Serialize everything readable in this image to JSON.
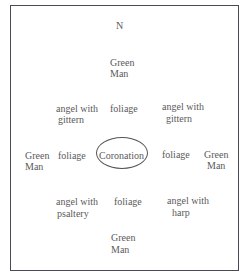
{
  "diagram": {
    "north": "N",
    "top_green_man": [
      "Green",
      "Man"
    ],
    "row1": {
      "left": [
        "angel with",
        "gittern"
      ],
      "center": "foliage",
      "right": [
        "angel with",
        "gittern"
      ]
    },
    "row2": {
      "far_left": [
        "Green",
        "Man"
      ],
      "left": "foliage",
      "center": "Coronation",
      "right": "foliage",
      "far_right": [
        "Green",
        "Man"
      ]
    },
    "row3": {
      "left": [
        "angel with",
        "psaltery"
      ],
      "center": "foliage",
      "right": [
        "angel with",
        "harp"
      ]
    },
    "bottom_green_man": [
      "Green",
      "Man"
    ]
  }
}
